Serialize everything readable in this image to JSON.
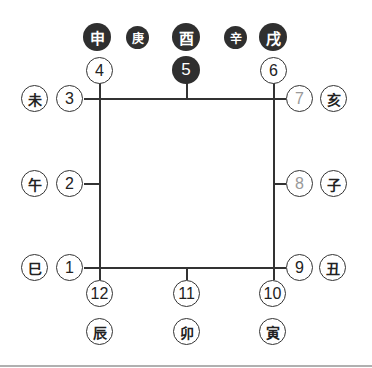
{
  "top_row": {
    "shen": "申",
    "geng": "庚",
    "you": "酉",
    "xin": "辛",
    "xu": "戌"
  },
  "numbers": {
    "n1": "1",
    "n2": "2",
    "n3": "3",
    "n4": "4",
    "n5": "5",
    "n6": "6",
    "n7": "7",
    "n8": "8",
    "n9": "9",
    "n10": "10",
    "n11": "11",
    "n12": "12"
  },
  "branches": {
    "wei": "未",
    "wu": "午",
    "si": "巳",
    "hai": "亥",
    "zi": "子",
    "chou": "丑",
    "chen": "辰",
    "mao": "卯",
    "yin": "寅"
  },
  "colors": {
    "dark": "#2f2f2f",
    "line": "#333333",
    "muted_number": "#999999",
    "separator": "#b0b0b0"
  }
}
